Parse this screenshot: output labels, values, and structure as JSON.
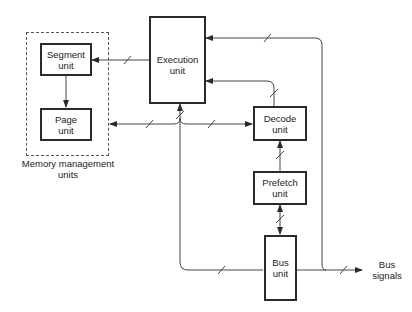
{
  "diagram": {
    "groups": [
      {
        "id": "mmu",
        "label_line1": "Memory management",
        "label_line2": "units"
      }
    ],
    "nodes": {
      "segment": {
        "line1": "Segment",
        "line2": "unit"
      },
      "page": {
        "line1": "Page",
        "line2": "unit"
      },
      "execution": {
        "line1": "Execution",
        "line2": "unit"
      },
      "decode": {
        "line1": "Decode",
        "line2": "unit"
      },
      "prefetch": {
        "line1": "Prefetch",
        "line2": "unit"
      },
      "bus": {
        "line1": "Bus",
        "line2": "unit"
      }
    },
    "external": {
      "bus_signals": {
        "line1": "Bus",
        "line2": "signals"
      }
    },
    "edges": [
      {
        "from": "execution",
        "to": "segment",
        "bus": true
      },
      {
        "from": "segment",
        "to": "page",
        "bus": false
      },
      {
        "from": "page",
        "to": "decode",
        "bidirectional": true,
        "bus": true
      },
      {
        "from": "bus",
        "to": "execution",
        "bus": true
      },
      {
        "from": "decode",
        "to": "execution",
        "bus": true
      },
      {
        "from": "prefetch",
        "to": "decode",
        "bus": true
      },
      {
        "from": "prefetch",
        "to": "bus",
        "bidirectional": true,
        "bus": true
      },
      {
        "from": "bus_signals",
        "to": "execution",
        "bus": true
      },
      {
        "from": "execution",
        "to": "bus",
        "bus": true
      },
      {
        "from": "bus",
        "to": "bus_signals",
        "bus": true
      }
    ]
  }
}
